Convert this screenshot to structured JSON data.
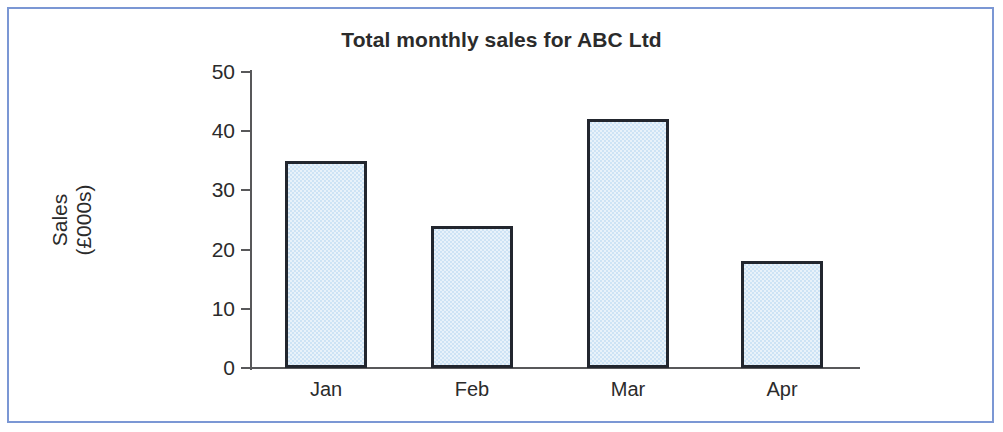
{
  "figure": {
    "border_color": "#7b97d4",
    "background": "#ffffff"
  },
  "chart_data": {
    "type": "bar",
    "title": "Total monthly sales for ABC Ltd",
    "categories": [
      "Jan",
      "Feb",
      "Mar",
      "Apr"
    ],
    "values": [
      35,
      24,
      42,
      18
    ],
    "xlabel": "",
    "ylabel": "Sales (£000s)",
    "ylabel_lines": [
      "Sales",
      "(£000s)"
    ],
    "ylim": [
      0,
      50
    ],
    "yticks": [
      0,
      10,
      20,
      30,
      40,
      50
    ],
    "ytick_labels": [
      "0",
      "10",
      "20",
      "30",
      "40",
      "50"
    ],
    "grid": false,
    "legend": false,
    "bar_fill_color": "#cde3f5",
    "bar_edge_color": "#22262e",
    "axis_color": "#58585a",
    "text_color": "#2b2b2b"
  }
}
